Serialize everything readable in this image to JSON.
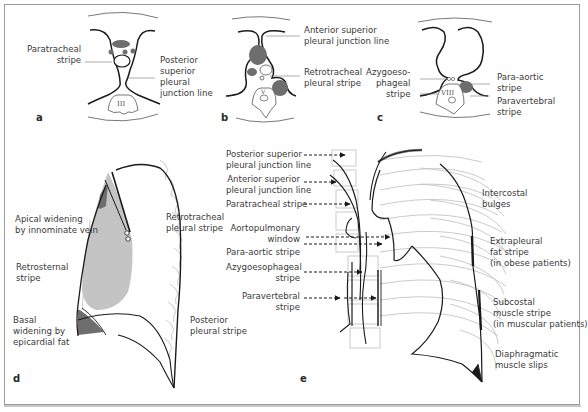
{
  "figure": {
    "panels": [
      {
        "id": "a",
        "letter": "a",
        "labels": [
          "Paratracheal\nstripe",
          "Posterior\nsuperior\npleural\njunction line"
        ],
        "vertebra": "III"
      },
      {
        "id": "b",
        "letter": "b",
        "labels": [
          "Anterior superior\npleural junction line",
          "Retrotracheal\npleural stripe"
        ],
        "vertebra": "V"
      },
      {
        "id": "c",
        "letter": "c",
        "labels": [
          "Azygoeso-\nphageal\nstripe",
          "Para-aortic\nstripe",
          "Paravertebral\nstripe"
        ],
        "vertebra": "VIII"
      },
      {
        "id": "d",
        "letter": "d",
        "labels": [
          "Apical widening\nby innominate vein",
          "Retrotracheal\npleural stripe",
          "Retrosternal\nstripe",
          "Basal\nwidening by\nepicardial fat",
          "Posterior\npleural stripe"
        ]
      },
      {
        "id": "e",
        "letter": "e",
        "labels": [
          "Posterior superior\npleural junction line",
          "Anterior superior\npleural junction line",
          "Paratracheal stripe",
          "Aortopulmonary\nwindow",
          "Para-aortic stripe",
          "Azygoesophageal\nstripe",
          "Paravertebral\nstripe",
          "Intercostal\nbulges",
          "Extrapleural\nfat stripe\n(in obese patients)",
          "Subcostal\nmuscle stripe\n(in muscular patients)",
          "Diaphragmatic\nmuscle slips"
        ]
      }
    ]
  },
  "colors": {
    "border": "#9a9a9a",
    "ink": "#1a1a1a",
    "soft_gray": "#c4c4c4",
    "mid_gray": "#8a8a8a",
    "dark_gray": "#6e6e6e",
    "text": "#3a3a3a"
  }
}
